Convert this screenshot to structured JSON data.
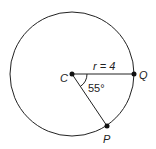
{
  "diagram": {
    "circle": {
      "cx": 72,
      "cy": 74,
      "r": 62
    },
    "points": {
      "C": {
        "label": "C",
        "x": 72,
        "y": 74
      },
      "Q": {
        "label": "Q",
        "x": 134,
        "y": 74
      },
      "P": {
        "label": "P",
        "x": 107,
        "y": 126
      }
    },
    "radius_label": "r = 4",
    "angle_label": "55°",
    "colors": {
      "stroke": "#222222",
      "background": "#ffffff"
    }
  }
}
